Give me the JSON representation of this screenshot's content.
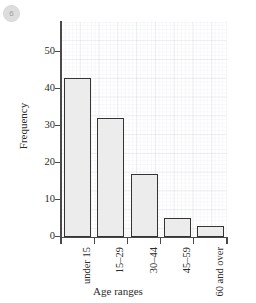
{
  "badge": {
    "label": "6",
    "name": "question-number-badge"
  },
  "chart_data": {
    "type": "bar",
    "title": "",
    "categories": [
      "under 15",
      "15–29",
      "30–44",
      "45–59",
      "60 and over"
    ],
    "values": [
      43,
      32,
      17,
      5,
      3
    ],
    "xlabel": "Age ranges",
    "ylabel": "Frequency",
    "ylim": [
      0,
      58
    ],
    "yticks": [
      0,
      10,
      20,
      30,
      40,
      50
    ],
    "ytick_labels": [
      "0",
      "10",
      "20",
      "30",
      "40",
      "50"
    ],
    "grid": true,
    "grid_style": "graph-paper",
    "legend": null,
    "bar_fill_color": "#ececec",
    "bar_edge_color": "#343434",
    "background_color": "#ffffff",
    "axis_color": "#4a4a4a"
  }
}
